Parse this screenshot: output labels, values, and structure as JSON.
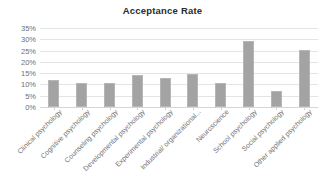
{
  "chart_data": {
    "type": "bar",
    "title": "Acceptance Rate",
    "xlabel": "",
    "ylabel": "",
    "ylim": [
      0,
      35
    ],
    "ytick_labels": [
      "35%",
      "30%",
      "25%",
      "20%",
      "15%",
      "10%",
      "5%",
      "0%"
    ],
    "ytick_values": [
      35,
      30,
      25,
      20,
      15,
      10,
      5,
      0
    ],
    "grid": true,
    "legend": "none",
    "bar_color": "#a3a3a3",
    "categories": [
      "Clinical psychology",
      "Cognitive psychology",
      "Counseling psychology",
      "Developmental psychology",
      "Experimental psychology",
      "Industrial/ organizational...",
      "Neuroscience",
      "School psychology",
      "Social psychology",
      "Other applied psychology"
    ],
    "values": [
      11.8,
      10.6,
      10.8,
      14.2,
      12.8,
      14.7,
      10.7,
      29.4,
      7.3,
      25.4
    ]
  }
}
